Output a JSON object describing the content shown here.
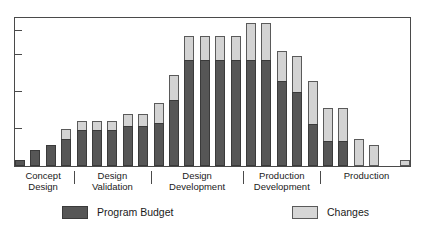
{
  "chart_data": {
    "type": "bar",
    "subtype": "stacked-vertical",
    "title": "",
    "title_remnant": "",
    "xlabel": "",
    "ylabel": "",
    "grid": false,
    "axis_tick_labels": [],
    "ytick_count": 4,
    "ytick_positions_pct": [
      25,
      50,
      75,
      91
    ],
    "legend_position": "bottom",
    "categories": [
      "1",
      "2",
      "3",
      "4",
      "5",
      "6",
      "7",
      "8",
      "9",
      "10",
      "11",
      "12",
      "13",
      "14",
      "15",
      "16",
      "17",
      "18",
      "19",
      "20",
      "21",
      "22",
      "23",
      "24",
      "25",
      "26"
    ],
    "series": [
      {
        "name": "Program Budget",
        "color": "#565656",
        "values": [
          4,
          11,
          14,
          18,
          24,
          24,
          24,
          27,
          27,
          29,
          44,
          71,
          71,
          71,
          71,
          71,
          71,
          57,
          50,
          28,
          17,
          17,
          0,
          0,
          0,
          0
        ]
      },
      {
        "name": "Changes",
        "color": "#d3d3d3",
        "values": [
          0,
          0,
          0,
          7,
          6,
          6,
          6,
          8,
          8,
          13,
          17,
          16,
          16,
          16,
          16,
          25,
          25,
          20,
          24,
          29,
          22,
          22,
          18,
          14,
          0,
          4
        ]
      }
    ],
    "totals": [
      4,
      11,
      14,
      25,
      30,
      30,
      30,
      35,
      35,
      42,
      61,
      87,
      87,
      87,
      87,
      96,
      96,
      77,
      74,
      57,
      39,
      39,
      18,
      14,
      0,
      4
    ],
    "bar_count": 26,
    "ylim": [
      0,
      100
    ],
    "phases": [
      {
        "line1": "Concept",
        "line2": "Design",
        "start_bar": 1,
        "end_bar": 4
      },
      {
        "line1": "Design",
        "line2": "Validation",
        "start_bar": 5,
        "end_bar": 9
      },
      {
        "line1": "Design",
        "line2": "Development",
        "start_bar": 10,
        "end_bar": 15
      },
      {
        "line1": "Production",
        "line2": "Development",
        "start_bar": 16,
        "end_bar": 20
      },
      {
        "line1": "Production",
        "line2": "",
        "start_bar": 21,
        "end_bar": 26
      }
    ]
  },
  "legend": {
    "budget": {
      "label": "Program Budget",
      "color": "#565656"
    },
    "changes": {
      "label": "Changes",
      "color": "#d3d3d3"
    }
  },
  "colors": {
    "budget": "#565656",
    "changes": "#d3d3d3",
    "axis": "#4a4a4a",
    "background": "#ffffff",
    "text": "#1a1a1a"
  }
}
